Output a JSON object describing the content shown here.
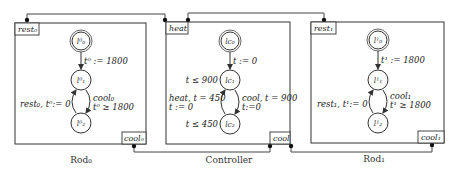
{
  "automata": [
    {
      "caption": "Rod₀",
      "ports": {
        "top": "rest₀",
        "bottom": "cool₀"
      },
      "states": [
        "l⁰₀",
        "l⁰₁",
        "l⁰₂"
      ],
      "edges": {
        "init_to_1": "t⁰ := 1800",
        "back_2_to_1": "rest₀, t⁰:= 0",
        "fwd_1_to_2_a": "cool₀",
        "fwd_1_to_2_b": "t⁰ ≥ 1800"
      }
    },
    {
      "caption": "Controller",
      "ports": {
        "top": "heat",
        "bottom": "cool"
      },
      "states": [
        "lc₀",
        "lc₁",
        "lc₂"
      ],
      "invariants": {
        "lc1": "t ≤ 900",
        "lc2": "t ≤ 450"
      },
      "edges": {
        "init_to_1": "t := 0",
        "back_2_to_1_a": "heat, t = 450",
        "back_2_to_1_b": "t := 0",
        "fwd_1_to_2_a": "cool, t = 900",
        "fwd_1_to_2_b": "t:=0"
      }
    },
    {
      "caption": "Rod₁",
      "ports": {
        "top": "rest₁",
        "bottom": "cool₁"
      },
      "states": [
        "l¹₀",
        "l¹₁",
        "l¹₂"
      ],
      "edges": {
        "init_to_1": "t¹ := 1800",
        "back_2_to_1": "rest₁, t¹:= 0",
        "fwd_1_to_2_a": "cool₁",
        "fwd_1_to_2_b": "t¹ ≥ 1800"
      }
    }
  ]
}
